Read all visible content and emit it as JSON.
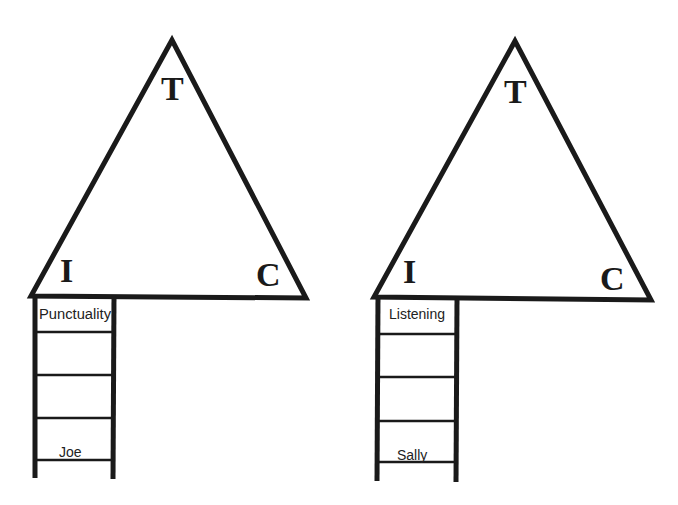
{
  "colors": {
    "stroke": "#1a1a1a",
    "background": "#ffffff"
  },
  "diagrams": [
    {
      "id": "left",
      "triangle": {
        "top_label": "T",
        "left_label": "I",
        "right_label": "C"
      },
      "ladder": {
        "top_label": "Punctuality",
        "bottom_label": "Joe",
        "rungs": 4
      }
    },
    {
      "id": "right",
      "triangle": {
        "top_label": "T",
        "left_label": "I",
        "right_label": "C"
      },
      "ladder": {
        "top_label": "Listening",
        "bottom_label": "Sally",
        "rungs": 4
      }
    }
  ]
}
